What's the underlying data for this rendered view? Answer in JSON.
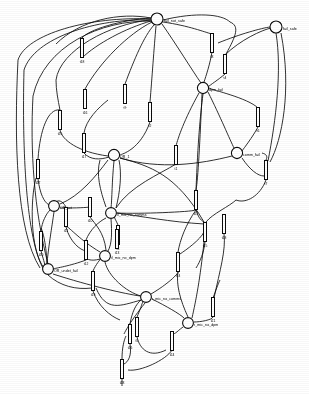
{
  "diagram": {
    "type": "petri-net",
    "width": 309,
    "height": 394,
    "stroke_color": "#111111",
    "fill_color": "#ffffff",
    "places": [
      {
        "id": "fail_not_safe",
        "label": "fail_not_safe",
        "cx": 157,
        "cy": 19,
        "r": 6.0,
        "label_dx": 7,
        "label_dy": 3
      },
      {
        "id": "fail_safe",
        "label": "fail_safe",
        "cx": 276,
        "cy": 27,
        "r": 6.0,
        "label_dx": 7,
        "label_dy": 3
      },
      {
        "id": "dpm_fail",
        "label": "dpm_fail",
        "cx": 203,
        "cy": 88,
        "r": 5.6,
        "label_dx": 6,
        "label_dy": 3
      },
      {
        "id": "comm_fail",
        "label": "comm_fail",
        "cx": 237,
        "cy": 153,
        "r": 5.6,
        "label_dx": 6,
        "label_dy": 3
      },
      {
        "id": "OR_1",
        "label": "OR_1",
        "cx": 114,
        "cy": 155,
        "r": 5.6,
        "label_dx": 6,
        "label_dy": 3
      },
      {
        "id": "OR_tot",
        "label": "OR_tot",
        "cx": 54,
        "cy": 206,
        "r": 5.4,
        "label_dx": 6,
        "label_dy": 3
      },
      {
        "id": "il_mic_no_comms",
        "label": "il_mic_no_comms",
        "cx": 111,
        "cy": 213,
        "r": 5.4,
        "label_dx": 6,
        "label_dy": 3
      },
      {
        "id": "il_mic_no_dpm",
        "label": "il_mic_no_dpm",
        "cx": 105,
        "cy": 256,
        "r": 5.4,
        "label_dx": 6,
        "label_dy": 3
      },
      {
        "id": "OR_undet_fail",
        "label": "OR_undet_fail",
        "cx": 48,
        "cy": 269,
        "r": 5.4,
        "label_dx": 6,
        "label_dy": 3
      },
      {
        "id": "r_mic_no_comms",
        "label": "r_mic_no_comms",
        "cx": 146,
        "cy": 297,
        "r": 5.4,
        "label_dx": 6,
        "label_dy": 3
      },
      {
        "id": "r_mic_no_dpm",
        "label": "r_mic_no_dpm",
        "cx": 188,
        "cy": 323,
        "r": 5.4,
        "label_dx": 6,
        "label_dy": 3
      }
    ],
    "transitions": [
      {
        "id": "t18",
        "label": "t18",
        "cx": 82,
        "cy": 48,
        "w": 3.0,
        "h": 19,
        "rot": 0
      },
      {
        "id": "t8",
        "label": "t8",
        "cx": 212,
        "cy": 43,
        "w": 3.0,
        "h": 19,
        "rot": 0
      },
      {
        "id": "t4",
        "label": "t4",
        "cx": 225,
        "cy": 64,
        "w": 3.0,
        "h": 19,
        "rot": 0
      },
      {
        "id": "t16",
        "label": "t16",
        "cx": 85,
        "cy": 99,
        "w": 3.0,
        "h": 19,
        "rot": 0
      },
      {
        "id": "t9",
        "label": "t9",
        "cx": 125,
        "cy": 94,
        "w": 3.0,
        "h": 19,
        "rot": 0
      },
      {
        "id": "t2",
        "label": "t2",
        "cx": 150,
        "cy": 112,
        "w": 3.0,
        "h": 19,
        "rot": 0
      },
      {
        "id": "t6",
        "label": "t6",
        "cx": 258,
        "cy": 117,
        "w": 3.0,
        "h": 19,
        "rot": 0
      },
      {
        "id": "t17",
        "label": "t17",
        "cx": 84,
        "cy": 143,
        "w": 3.0,
        "h": 19,
        "rot": 0
      },
      {
        "id": "t1",
        "label": "t1",
        "cx": 176,
        "cy": 155,
        "w": 3.0,
        "h": 19,
        "rot": 0
      },
      {
        "id": "t7",
        "label": "t7",
        "cx": 266,
        "cy": 170,
        "w": 3.0,
        "h": 19,
        "rot": 0
      },
      {
        "id": "t27",
        "label": "t27",
        "cx": 38,
        "cy": 169,
        "w": 3.0,
        "h": 19,
        "rot": 0
      },
      {
        "id": "t10",
        "label": "t10",
        "cx": 90,
        "cy": 207,
        "w": 3.0,
        "h": 19,
        "rot": 0
      },
      {
        "id": "t11",
        "label": "t11",
        "cx": 66,
        "cy": 217,
        "w": 3.0,
        "h": 19,
        "rot": 0
      },
      {
        "id": "t3",
        "label": "t3",
        "cx": 118,
        "cy": 235,
        "w": 3.0,
        "h": 19,
        "rot": 0
      },
      {
        "id": "t15",
        "label": "t15",
        "cx": 205,
        "cy": 232,
        "w": 3.0,
        "h": 19,
        "rot": 0
      },
      {
        "id": "t23",
        "label": "t23",
        "cx": 224,
        "cy": 224,
        "w": 3.0,
        "h": 19,
        "rot": 0
      },
      {
        "id": "t12",
        "label": "t12",
        "cx": 86,
        "cy": 250,
        "w": 3.0,
        "h": 19,
        "rot": 0
      },
      {
        "id": "t20",
        "label": "t20",
        "cx": 41,
        "cy": 241,
        "w": 3.0,
        "h": 19,
        "rot": 0
      },
      {
        "id": "t14",
        "label": "t14",
        "cx": 178,
        "cy": 262,
        "w": 3.0,
        "h": 19,
        "rot": 0
      },
      {
        "id": "t19",
        "label": "t19",
        "cx": 93,
        "cy": 281,
        "w": 3.0,
        "h": 19,
        "rot": 0
      },
      {
        "id": "t21",
        "label": "t21",
        "cx": 213,
        "cy": 307,
        "w": 3.0,
        "h": 19,
        "rot": 0
      },
      {
        "id": "t5",
        "label": "t5",
        "cx": 137,
        "cy": 327,
        "w": 3.0,
        "h": 19,
        "rot": 0
      },
      {
        "id": "t26",
        "label": "t26",
        "cx": 130,
        "cy": 334,
        "w": 3.0,
        "h": 19,
        "rot": 0
      },
      {
        "id": "t24",
        "label": "t24",
        "cx": 172,
        "cy": 341,
        "w": 3.0,
        "h": 19,
        "rot": 0
      },
      {
        "id": "t28",
        "label": "t28",
        "cx": 122,
        "cy": 369,
        "w": 3.0,
        "h": 19,
        "rot": 0
      },
      {
        "id": "t13",
        "label": "t13",
        "cx": 117,
        "cy": 239,
        "w": 3.0,
        "h": 19,
        "rot": 0
      },
      {
        "id": "t22",
        "label": "t22",
        "cx": 196,
        "cy": 200,
        "w": 3.0,
        "h": 19,
        "rot": 0
      },
      {
        "id": "t25",
        "label": "t25",
        "cx": 60,
        "cy": 120,
        "w": 3.0,
        "h": 19,
        "rot": 0
      }
    ],
    "arcs": [
      {
        "d": "M 18 60 C 14 140 16 230 40 268"
      },
      {
        "d": "M 18 60 C 26 34 90 16 151 19"
      },
      {
        "d": "M 24 70 C 22 150 26 240 44 270"
      },
      {
        "d": "M 24 70 C 34 38 96 18 151 20"
      },
      {
        "d": "M 33 96 C 30 150 34 210 48 264"
      },
      {
        "d": "M 33 96 C 44 46 100 20 152 21"
      },
      {
        "d": "M 82 58 C 96 44 126 28 151 21"
      },
      {
        "d": "M 82 38 C 88 30 120 20 151 18"
      },
      {
        "d": "M 85 89 C 100 62 128 34 152 22"
      },
      {
        "d": "M 125 84 C 134 60 144 36 154 25"
      },
      {
        "d": "M 150 102 C 152 78 154 48 156 26"
      },
      {
        "d": "M 150 122 C 140 150 122 154 120 155"
      },
      {
        "d": "M 162 24 C 176 44 192 70 201 83"
      },
      {
        "d": "M 163 22 C 190 26 204 32 212 34"
      },
      {
        "d": "M 212 52 C 210 64 206 76 204 82"
      },
      {
        "d": "M 218 43 C 240 34 262 28 270 27"
      },
      {
        "d": "M 225 55 C 240 40 262 30 271 28"
      },
      {
        "d": "M 225 74 C 218 80 210 85 208 87"
      },
      {
        "d": "M 276 33 C 282 70 276 120 268 161"
      },
      {
        "d": "M 281 33 C 292 90 282 140 270 162"
      },
      {
        "d": "M 258 108 C 248 98 212 90 209 88"
      },
      {
        "d": "M 258 127 C 252 138 244 148 242 151"
      },
      {
        "d": "M 266 180 C 260 196 246 204 236 200"
      },
      {
        "d": "M 266 160 C 268 156 266 154 262 153"
      },
      {
        "d": "M 203 94 C 200 118 198 140 196 190"
      },
      {
        "d": "M 199 93 C 184 120 178 138 176 146"
      },
      {
        "d": "M 208 92 C 220 116 230 140 234 148"
      },
      {
        "d": "M 176 164 C 160 174 130 186 116 208"
      },
      {
        "d": "M 232 156 C 200 164 160 170 120 158"
      },
      {
        "d": "M 196 210 C 190 212 140 214 117 213"
      },
      {
        "d": "M 114 161 C 112 180 112 200 111 208"
      },
      {
        "d": "M 108 160 C 96 176 80 196 60 204"
      },
      {
        "d": "M 120 158 C 150 166 176 174 204 222"
      },
      {
        "d": "M 84 133 C 86 120 98 108 108 100"
      },
      {
        "d": "M 84 153 C 90 160 100 160 109 157"
      },
      {
        "d": "M 38 159 C 40 130 48 108 60 110"
      },
      {
        "d": "M 38 179 C 40 194 44 202 49 205"
      },
      {
        "d": "M 60 130 C 62 140 78 152 108 156"
      },
      {
        "d": "M 54 212 C 52 226 48 250 47 264"
      },
      {
        "d": "M 60 208 C 72 208 82 208 90 207"
      },
      {
        "d": "M 66 227 C 70 242 80 250 86 251"
      },
      {
        "d": "M 66 207 C 62 200 58 200 56 202"
      },
      {
        "d": "M 90 217 C 95 224 104 232 106 250"
      },
      {
        "d": "M 111 219 C 112 232 112 244 108 251"
      },
      {
        "d": "M 117 213 C 140 216 170 222 204 224"
      },
      {
        "d": "M 118 245 C 118 240 118 238 117 230"
      },
      {
        "d": "M 118 225 C 116 220 114 218 114 215"
      },
      {
        "d": "M 105 262 C 108 276 126 292 141 296"
      },
      {
        "d": "M 100 259 C 90 262 88 258 86 260"
      },
      {
        "d": "M 86 240 C 90 230 98 222 106 218"
      },
      {
        "d": "M 41 231 C 42 222 46 214 50 210"
      },
      {
        "d": "M 41 251 C 44 262 46 266 44 268"
      },
      {
        "d": "M 48 275 C 60 286 76 290 92 288"
      },
      {
        "d": "M 53 274 C 90 286 126 294 140 296"
      },
      {
        "d": "M 93 271 C 96 264 100 260 101 258"
      },
      {
        "d": "M 93 291 C 98 306 110 316 120 320"
      },
      {
        "d": "M 152 299 C 166 306 180 314 184 318"
      },
      {
        "d": "M 151 294 C 168 284 178 274 178 272"
      },
      {
        "d": "M 178 252 C 180 240 186 224 196 210"
      },
      {
        "d": "M 205 242 C 204 252 200 262 196 268"
      },
      {
        "d": "M 224 234 C 226 250 220 270 214 298"
      },
      {
        "d": "M 213 317 C 212 320 200 322 194 322"
      },
      {
        "d": "M 213 298 C 216 290 218 284 220 280"
      },
      {
        "d": "M 183 327 C 176 332 174 336 172 332"
      },
      {
        "d": "M 172 350 C 166 360 140 372 128 370"
      },
      {
        "d": "M 137 337 C 140 350 150 358 166 350"
      },
      {
        "d": "M 137 317 C 140 310 142 304 143 301"
      },
      {
        "d": "M 130 344 C 132 356 128 362 124 364"
      },
      {
        "d": "M 130 324 C 132 312 136 304 141 300"
      },
      {
        "d": "M 122 359 C 122 348 124 340 126 336"
      },
      {
        "d": "M 122 379 C 122 382 122 384 122 386"
      },
      {
        "d": "M 192 318 C 196 300 200 280 204 242"
      },
      {
        "d": "M 188 317 C 180 300 176 284 178 272"
      },
      {
        "d": "M 196 190 C 198 180 200 140 202 94"
      },
      {
        "d": "M 196 210 C 198 216 200 220 204 222"
      },
      {
        "d": "M 60 110 C 58 100 56 90 56 80"
      },
      {
        "d": "M 56 80 C 60 50 110 24 150 20"
      },
      {
        "d": "M 44 268 C 30 250 30 200 36 178"
      },
      {
        "d": "M 100 252 C 80 240 70 228 66 226"
      },
      {
        "d": "M 106 207 C 100 190 96 174 100 160"
      },
      {
        "d": "M 242 158 C 250 170 258 176 264 176"
      },
      {
        "d": "M 236 200 C 230 206 212 214 206 222"
      },
      {
        "d": "M 151 18 C 120 12 80 20 56 44"
      },
      {
        "d": "M 163 20 C 196 12 222 14 230 22"
      },
      {
        "d": "M 230 22 C 240 26 236 36 226 54"
      },
      {
        "d": "M 116 208 C 120 192 122 174 119 160"
      },
      {
        "d": "M 145 303 C 130 322 126 330 124 334"
      },
      {
        "d": "M 141 300 C 120 306 106 312 96 288"
      },
      {
        "d": "M 204 232 C 200 240 186 250 180 254"
      },
      {
        "d": "M 86 260 C 70 266 56 268 53 269"
      },
      {
        "d": "M 47 264 C 46 240 42 230 41 228"
      }
    ]
  }
}
